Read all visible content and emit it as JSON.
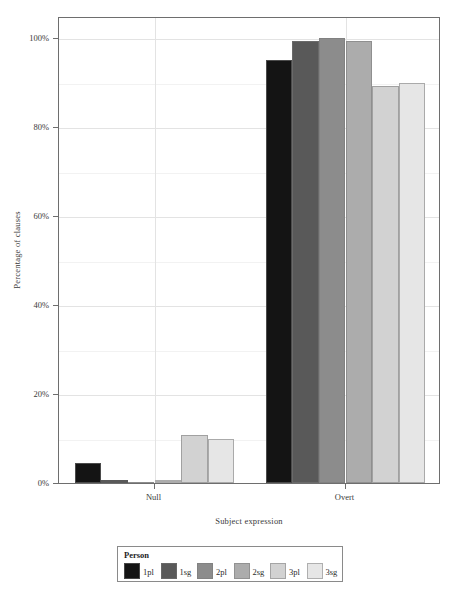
{
  "chart_data": {
    "type": "bar",
    "title": "",
    "subtitle": "",
    "xlabel": "Subject expression",
    "ylabel": "Percentage of clauses",
    "categories": [
      "Null",
      "Overt"
    ],
    "ylim": [
      0,
      105
    ],
    "ytick_values": [
      0,
      20,
      40,
      60,
      80,
      100
    ],
    "ytick_labels": [
      "0%",
      "20%",
      "40%",
      "60%",
      "80%",
      "100%"
    ],
    "grid": true,
    "grid_orientation": "horizontal-and-vertical",
    "legend_title": "Person",
    "legend_position": "bottom",
    "series": [
      {
        "name": "1pl",
        "color": "#141414",
        "values": [
          4.5,
          95.0
        ]
      },
      {
        "name": "1sg",
        "color": "#595959",
        "values": [
          0.6,
          99.4
        ]
      },
      {
        "name": "2pl",
        "color": "#8c8c8c",
        "values": [
          0.2,
          100.0
        ]
      },
      {
        "name": "2sg",
        "color": "#acacac",
        "values": [
          0.6,
          99.4
        ]
      },
      {
        "name": "3pl",
        "color": "#d2d2d2",
        "values": [
          10.8,
          89.2
        ]
      },
      {
        "name": "3sg",
        "color": "#e6e6e6",
        "values": [
          10.0,
          90.0
        ]
      }
    ]
  },
  "axes": {
    "x_title": "Subject expression",
    "y_title": "Percentage of clauses"
  },
  "legend": {
    "title": "Person",
    "items": [
      {
        "label": "1pl",
        "color": "#141414"
      },
      {
        "label": "1sg",
        "color": "#595959"
      },
      {
        "label": "2pl",
        "color": "#8c8c8c"
      },
      {
        "label": "2sg",
        "color": "#acacac"
      },
      {
        "label": "3pl",
        "color": "#d2d2d2"
      },
      {
        "label": "3sg",
        "color": "#e6e6e6"
      }
    ]
  }
}
